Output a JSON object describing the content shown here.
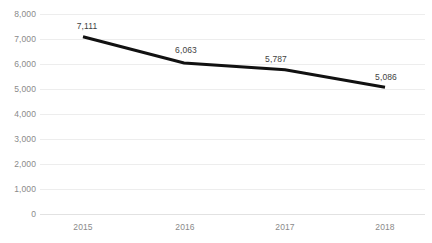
{
  "chart_data": {
    "type": "line",
    "title": "",
    "subtitle": "",
    "xlabel": "",
    "ylabel": "",
    "categories": [
      "2015",
      "2016",
      "2017",
      "2018"
    ],
    "values": [
      7111,
      6063,
      5787,
      5086
    ],
    "point_labels": [
      "7,111",
      "6,063",
      "5,787",
      "5,086"
    ],
    "ylim": [
      0,
      8000
    ],
    "ytick_values": [
      8000,
      7000,
      6000,
      5000,
      4000,
      3000,
      2000,
      1000,
      0
    ],
    "ytick_labels": [
      "8,000",
      "7,000",
      "6,000",
      "5,000",
      "4,000",
      "3,000",
      "2,000",
      "1,000",
      "0"
    ],
    "grid": "horizontal",
    "legend": "none",
    "series": [
      {
        "name": "",
        "values": [
          7111,
          6063,
          5787,
          5086
        ]
      }
    ],
    "colors": {
      "line": "#111111",
      "gridline": "#ededed",
      "axis_text": "#8a8a8a",
      "label_text": "#3f3f3f",
      "background": "#ffffff"
    }
  }
}
